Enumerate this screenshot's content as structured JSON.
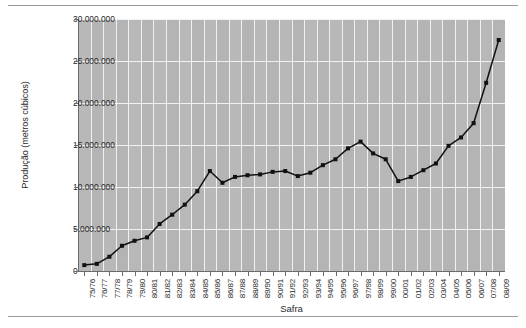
{
  "axes": {
    "ylabel": "Produção (metros cúbicos)",
    "xlabel": "Safra"
  },
  "chart_data": {
    "type": "line",
    "title": "",
    "subtitle": "",
    "xlabel": "Safra",
    "ylabel": "Produção (metros cúbicos)",
    "ylim": [
      0,
      30000000
    ],
    "ytick_values": [
      0,
      5000000,
      10000000,
      15000000,
      20000000,
      25000000,
      30000000
    ],
    "ytick_labels": [
      "0",
      "5.000.000",
      "10.000.000",
      "15.000.000",
      "20.000.000",
      "25.000.000",
      "30.000.000"
    ],
    "grid": "horizontal and vertical white gridlines on gray panel",
    "legend": "none",
    "marker": "filled square",
    "line_color": "#111111",
    "panel_color": "#b4b4b4",
    "gridline_color": "#f4f4f4",
    "categories": [
      "75/76",
      "76/77",
      "77/78",
      "78/79",
      "79/80",
      "80/81",
      "81/82",
      "82/83",
      "83/84",
      "84/85",
      "85/86",
      "86/87",
      "87/88",
      "88/89",
      "89/90",
      "90/91",
      "91/92",
      "92/93",
      "93/94",
      "94/95",
      "95/96",
      "96/97",
      "97/98",
      "98/99",
      "99/00",
      "00/01",
      "01/02",
      "02/03",
      "03/04",
      "04/05",
      "05/06",
      "06/07",
      "07/08",
      "08/09"
    ],
    "values": [
      700000,
      850000,
      1700000,
      3000000,
      3600000,
      4000000,
      5600000,
      6700000,
      7900000,
      9500000,
      11900000,
      10500000,
      11200000,
      11400000,
      11500000,
      11800000,
      11900000,
      11300000,
      11700000,
      12600000,
      13300000,
      14600000,
      15400000,
      14000000,
      13300000,
      10700000,
      11200000,
      12000000,
      12800000,
      14900000,
      15900000,
      17600000,
      22400000,
      27500000
    ]
  }
}
